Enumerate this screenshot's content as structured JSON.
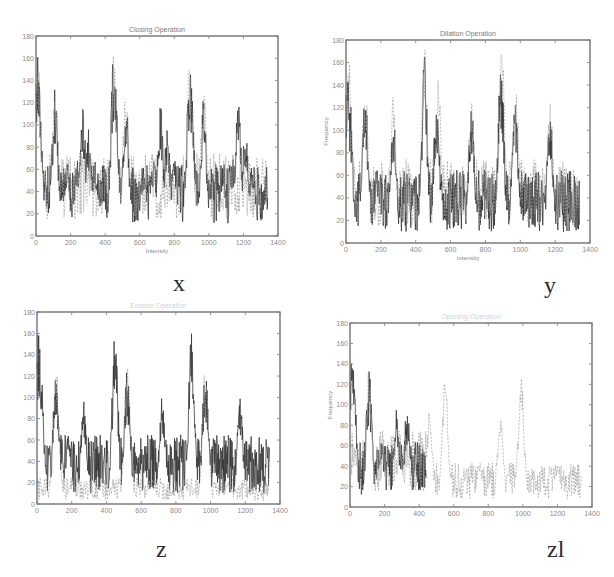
{
  "figure": {
    "captions": [
      "x",
      "y",
      "z",
      "zl"
    ]
  },
  "chart_data": [
    {
      "type": "line",
      "panel": "x",
      "title": "Closing Operation",
      "xlabel": "Intensity",
      "ylabel": "",
      "xlim": [
        0,
        1400
      ],
      "ylim": [
        0,
        180
      ],
      "xticks": [
        0,
        200,
        400,
        600,
        800,
        1000,
        1200,
        1400
      ],
      "yticks": [
        0,
        20,
        40,
        60,
        80,
        100,
        120,
        140,
        160,
        180
      ],
      "grid": false,
      "series": [
        {
          "name": "original",
          "style": "solid-dark",
          "peaks": [
            [
              10,
              165
            ],
            [
              20,
              135
            ],
            [
              30,
              20
            ],
            [
              50,
              45
            ],
            [
              110,
              135
            ],
            [
              130,
              10
            ],
            [
              180,
              65
            ],
            [
              240,
              70
            ],
            [
              270,
              120
            ],
            [
              300,
              100
            ],
            [
              340,
              70
            ],
            [
              380,
              40
            ],
            [
              410,
              10
            ],
            [
              450,
              165
            ],
            [
              460,
              135
            ],
            [
              520,
              130
            ],
            [
              570,
              10
            ],
            [
              620,
              65
            ],
            [
              680,
              70
            ],
            [
              720,
              120
            ],
            [
              760,
              100
            ],
            [
              800,
              70
            ],
            [
              860,
              10
            ],
            [
              890,
              165
            ],
            [
              900,
              135
            ],
            [
              970,
              130
            ],
            [
              1020,
              10
            ],
            [
              1080,
              65
            ],
            [
              1140,
              70
            ],
            [
              1170,
              120
            ],
            [
              1210,
              100
            ],
            [
              1250,
              70
            ],
            [
              1310,
              10
            ],
            [
              1330,
              40
            ]
          ]
        },
        {
          "name": "closed",
          "style": "dashed-light",
          "peaks": [
            [
              10,
              165
            ],
            [
              110,
              135
            ],
            [
              450,
              165
            ],
            [
              520,
              135
            ],
            [
              890,
              165
            ],
            [
              970,
              135
            ]
          ]
        }
      ]
    },
    {
      "type": "line",
      "panel": "y",
      "title": "Dilation Operation",
      "xlabel": "Intensity",
      "ylabel": "Frequency",
      "xlim": [
        0,
        1400
      ],
      "ylim": [
        0,
        180
      ],
      "xticks": [
        0,
        200,
        400,
        600,
        800,
        1000,
        1200,
        1400
      ],
      "yticks": [
        0,
        20,
        40,
        60,
        80,
        100,
        120,
        140,
        160,
        180
      ],
      "grid": false,
      "series": [
        {
          "name": "original",
          "style": "solid-dark",
          "peaks": [
            [
              10,
              165
            ],
            [
              20,
              135
            ],
            [
              110,
              135
            ],
            [
              130,
              10
            ],
            [
              180,
              65
            ],
            [
              270,
              120
            ],
            [
              410,
              10
            ],
            [
              450,
              165
            ],
            [
              520,
              130
            ],
            [
              570,
              10
            ],
            [
              720,
              120
            ],
            [
              860,
              10
            ],
            [
              890,
              165
            ],
            [
              970,
              130
            ],
            [
              1020,
              10
            ],
            [
              1170,
              120
            ],
            [
              1310,
              10
            ]
          ]
        },
        {
          "name": "dilated",
          "style": "dashed-light",
          "peaks": [
            [
              15,
              175
            ],
            [
              110,
              145
            ],
            [
              270,
              130
            ],
            [
              450,
              175
            ],
            [
              530,
              145
            ],
            [
              720,
              130
            ],
            [
              895,
              175
            ],
            [
              975,
              145
            ],
            [
              1170,
              130
            ]
          ]
        }
      ]
    },
    {
      "type": "line",
      "panel": "z",
      "title": "Erosion Operation",
      "xlabel": "",
      "ylabel": "",
      "xlim": [
        0,
        1400
      ],
      "ylim": [
        0,
        180
      ],
      "xticks": [
        0,
        200,
        400,
        600,
        800,
        1000,
        1200,
        1400
      ],
      "yticks": [
        0,
        20,
        40,
        60,
        80,
        100,
        120,
        140,
        160,
        180
      ],
      "grid": false,
      "series": [
        {
          "name": "original",
          "style": "solid-dark",
          "peaks": [
            [
              10,
              165
            ],
            [
              20,
              135
            ],
            [
              110,
              135
            ],
            [
              130,
              10
            ],
            [
              180,
              65
            ],
            [
              270,
              100
            ],
            [
              410,
              10
            ],
            [
              450,
              165
            ],
            [
              520,
              130
            ],
            [
              570,
              10
            ],
            [
              720,
              100
            ],
            [
              860,
              10
            ],
            [
              890,
              165
            ],
            [
              970,
              130
            ],
            [
              1020,
              10
            ],
            [
              1170,
              100
            ],
            [
              1310,
              10
            ]
          ]
        },
        {
          "name": "eroded",
          "style": "dashed-light",
          "peaks": [
            [
              110,
              130
            ],
            [
              200,
              20
            ],
            [
              520,
              130
            ],
            [
              650,
              20
            ],
            [
              970,
              130
            ],
            [
              1100,
              20
            ]
          ]
        }
      ]
    },
    {
      "type": "line",
      "panel": "zl",
      "title": "Opening Operation",
      "xlabel": "",
      "ylabel": "Frequency",
      "xlim": [
        0,
        1400
      ],
      "ylim": [
        0,
        180
      ],
      "xticks": [
        0,
        200,
        400,
        600,
        800,
        1000,
        1200,
        1400
      ],
      "yticks": [
        0,
        20,
        40,
        60,
        80,
        100,
        120,
        140,
        160,
        180
      ],
      "grid": false,
      "series": [
        {
          "name": "original",
          "style": "solid-dark",
          "xrange": [
            0,
            440
          ],
          "peaks": [
            [
              10,
              165
            ],
            [
              20,
              135
            ],
            [
              110,
              135
            ],
            [
              130,
              10
            ],
            [
              180,
              65
            ],
            [
              270,
              100
            ],
            [
              330,
              100
            ],
            [
              410,
              10
            ]
          ]
        },
        {
          "name": "opened",
          "style": "dashed-light",
          "xrange": [
            0,
            1340
          ],
          "peaks": [
            [
              110,
              135
            ],
            [
              460,
              95
            ],
            [
              550,
              130
            ],
            [
              750,
              45
            ],
            [
              870,
              90
            ],
            [
              990,
              130
            ],
            [
              1200,
              45
            ],
            [
              1300,
              10
            ]
          ]
        }
      ]
    }
  ]
}
